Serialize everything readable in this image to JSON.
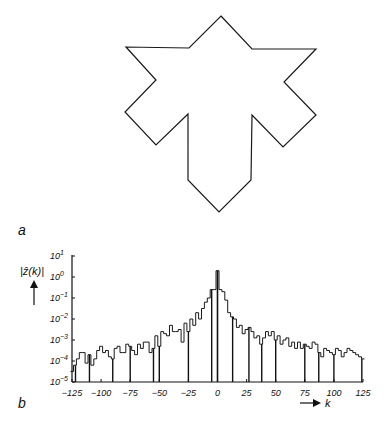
{
  "panels": {
    "a": {
      "label": "a",
      "description": "closed polygon outline (star/arrow-like shape)",
      "polygon": [
        [
          221,
          16
        ],
        [
          252,
          49
        ],
        [
          316,
          49
        ],
        [
          284,
          82
        ],
        [
          316,
          115
        ],
        [
          283,
          147
        ],
        [
          252,
          115
        ],
        [
          251,
          180
        ],
        [
          219,
          212
        ],
        [
          188,
          180
        ],
        [
          188,
          114
        ],
        [
          156,
          145
        ],
        [
          125,
          112
        ],
        [
          156,
          80
        ],
        [
          126,
          47
        ],
        [
          189,
          48
        ]
      ]
    },
    "b": {
      "label": "b"
    }
  },
  "chart_data": {
    "type": "line",
    "style": "step",
    "title": "",
    "xlabel": "k",
    "ylabel": "|ẑ(k)|",
    "yscale": "log",
    "xlim": [
      -125,
      125
    ],
    "ylim_exponents": [
      -5,
      1
    ],
    "x_ticks": [
      -125,
      -100,
      -75,
      -50,
      -25,
      0,
      25,
      50,
      75,
      100,
      125
    ],
    "y_tick_labels": [
      "10^1",
      "10^0",
      "10^-1",
      "10^-2",
      "10^-3",
      "10^-4",
      "10^-5"
    ],
    "y_tick_exponents": [
      1,
      0,
      -1,
      -2,
      -3,
      -4,
      -5
    ],
    "grid": false,
    "legend": null,
    "x": [
      -125,
      -122.5,
      -120,
      -117.5,
      -115,
      -112.5,
      -110,
      -107.5,
      -105,
      -102.5,
      -100,
      -97.5,
      -95,
      -92.5,
      -90,
      -87.5,
      -85,
      -82.5,
      -80,
      -77.5,
      -75,
      -72.5,
      -70,
      -67.5,
      -65,
      -62.5,
      -60,
      -57.5,
      -55,
      -52.5,
      -50,
      -47.5,
      -45,
      -42.5,
      -40,
      -37.5,
      -35,
      -32.5,
      -30,
      -27.5,
      -25,
      -22.5,
      -20,
      -17.5,
      -15,
      -12.5,
      -10,
      -7.5,
      -5,
      -2.5,
      0,
      2.5,
      5,
      7.5,
      10,
      12.5,
      15,
      17.5,
      20,
      22.5,
      25,
      27.5,
      30,
      32.5,
      35,
      37.5,
      40,
      42.5,
      45,
      47.5,
      50,
      52.5,
      55,
      57.5,
      60,
      62.5,
      65,
      67.5,
      70,
      72.5,
      75,
      77.5,
      80,
      82.5,
      85,
      87.5,
      90,
      92.5,
      95,
      97.5,
      100,
      102.5,
      105,
      107.5,
      110,
      112.5,
      115,
      117.5,
      120,
      122.5,
      125
    ],
    "log10_values": [
      -4.5,
      -4.2,
      -3.9,
      -3.6,
      -3.6,
      -4.1,
      -3.7,
      -4.2,
      -3.9,
      -3.5,
      -3.3,
      -3.6,
      -3.5,
      -3.8,
      -3.9,
      -3.4,
      -3.3,
      -3.6,
      -3.6,
      -3.2,
      -3.3,
      -3.5,
      -3.7,
      -3.2,
      -3.4,
      -3.1,
      -3.1,
      -3.6,
      -3.4,
      -2.8,
      -3.3,
      -2.6,
      -2.7,
      -2.8,
      -2.3,
      -2.6,
      -2.6,
      -2.5,
      -3.1,
      -2.2,
      -2.6,
      -2.0,
      -2.3,
      -1.7,
      -2.0,
      -1.5,
      -1.2,
      -1.0,
      -0.6,
      -0.6,
      0.3,
      -0.6,
      -0.7,
      -1.1,
      -1.7,
      -1.9,
      -2.0,
      -2.4,
      -2.3,
      -2.7,
      -2.5,
      -2.4,
      -2.6,
      -2.9,
      -2.8,
      -3.2,
      -2.9,
      -2.6,
      -2.8,
      -2.6,
      -3.0,
      -2.8,
      -3.2,
      -3.0,
      -2.9,
      -3.3,
      -3.1,
      -3.4,
      -3.1,
      -3.4,
      -3.2,
      -3.3,
      -3.4,
      -3.1,
      -3.2,
      -3.6,
      -3.8,
      -3.4,
      -3.5,
      -3.6,
      -3.7,
      -3.4,
      -3.5,
      -3.8,
      -3.6,
      -3.4,
      -3.5,
      -3.6,
      -3.7,
      -3.8,
      -3.9
    ],
    "deep_dips_k": [
      -122,
      -110,
      -90,
      -75,
      -55,
      -50,
      -25,
      -5,
      0,
      13,
      27,
      38,
      50,
      75,
      87,
      100,
      124
    ]
  }
}
